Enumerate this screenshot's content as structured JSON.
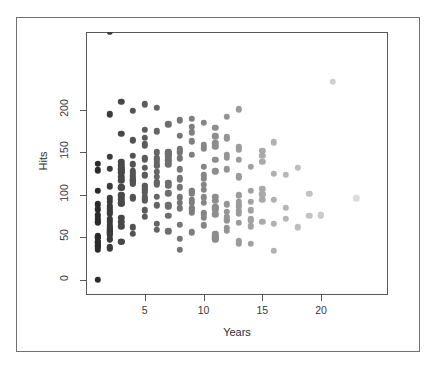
{
  "figure": {
    "clipped_header_text": "·  ·   ·      ·     · ·      ·     ·   · ·",
    "frame_color": "#6f6f73",
    "plot_box_color": "#58585c",
    "background": "#ffffff"
  },
  "chart_data": {
    "type": "scatter",
    "title": "",
    "subtitle": "",
    "xlabel": "Years",
    "ylabel": "Hits",
    "xlim": [
      0,
      25.7
    ],
    "ylim": [
      -18,
      292
    ],
    "grid": false,
    "legend": null,
    "xticks": [
      5,
      10,
      15,
      20
    ],
    "yticks": [
      0,
      50,
      100,
      150,
      200
    ],
    "point_shape": "filled-circle",
    "point_radius_px": 3.2,
    "color_scheme": "grayscale: darker points at low Years, lighter points at high Years",
    "color_dark": "#2b2b2b",
    "color_light": "#dcdcdc",
    "n_points": 263,
    "x": [
      13,
      3,
      11,
      2,
      11,
      2,
      3,
      2,
      13,
      10,
      9,
      4,
      6,
      13,
      3,
      15,
      5,
      8,
      1,
      14,
      2,
      9,
      3,
      5,
      2,
      8,
      13,
      3,
      20,
      8,
      5,
      3,
      1,
      17,
      2,
      14,
      2,
      11,
      2,
      4,
      10,
      8,
      5,
      6,
      4,
      12,
      6,
      11,
      1,
      16,
      3,
      13,
      7,
      2,
      4,
      9,
      5,
      18,
      2,
      6,
      5,
      12,
      4,
      7,
      1,
      15,
      3,
      10,
      2,
      8,
      6,
      13,
      4,
      11,
      2,
      19,
      5,
      9,
      3,
      7,
      1,
      14,
      6,
      12,
      2,
      10,
      4,
      16,
      3,
      8,
      5,
      11,
      1,
      13,
      7,
      9,
      2,
      15,
      4,
      6,
      3,
      12,
      1,
      10,
      5,
      8,
      2,
      14,
      6,
      11,
      4,
      7,
      3,
      17,
      1,
      9,
      5,
      13,
      2,
      10,
      6,
      12,
      4,
      8,
      3,
      15,
      1,
      11,
      7,
      9,
      2,
      16,
      5,
      10,
      4,
      13,
      3,
      7,
      1,
      12,
      6,
      8,
      2,
      14,
      5,
      9,
      3,
      11,
      4,
      18,
      1,
      10,
      7,
      13,
      2,
      8,
      6,
      12,
      5,
      15,
      3,
      9,
      1,
      11,
      4,
      7,
      2,
      20,
      6,
      10,
      5,
      13,
      3,
      8,
      1,
      14,
      4,
      9,
      7,
      11,
      2,
      12,
      5,
      16,
      3,
      10,
      6,
      8,
      1,
      13,
      4,
      15,
      2,
      9,
      7,
      11,
      5,
      12,
      3,
      17,
      1,
      10,
      6,
      14,
      4,
      8,
      2,
      13,
      5,
      9,
      3,
      11,
      7,
      19,
      1,
      12,
      6,
      10,
      4,
      15,
      2,
      8,
      5,
      13,
      3,
      9,
      1,
      16,
      7,
      11,
      4,
      12,
      6,
      10,
      2,
      14,
      5,
      8,
      3,
      13,
      1,
      9,
      7,
      11,
      21,
      6,
      4,
      12,
      2,
      10,
      5,
      1,
      3,
      8,
      15,
      13,
      9,
      7,
      11,
      23,
      6,
      12,
      2
    ],
    "y": [
      81,
      130,
      141,
      87,
      169,
      37,
      73,
      81,
      92,
      159,
      163,
      54,
      141,
      88,
      121,
      146,
      95,
      97,
      76,
      71,
      84,
      102,
      126,
      144,
      56,
      130,
      99,
      90,
      76,
      143,
      177,
      100,
      83,
      124,
      72,
      105,
      60,
      157,
      48,
      136,
      119,
      152,
      132,
      112,
      118,
      89,
      150,
      77,
      50,
      94,
      108,
      67,
      141,
      92,
      165,
      85,
      123,
      62,
      57,
      138,
      110,
      74,
      96,
      149,
      44,
      101,
      131,
      79,
      69,
      154,
      127,
      86,
      113,
      98,
      64,
      75,
      160,
      91,
      117,
      145,
      52,
      82,
      134,
      70,
      47,
      106,
      122,
      66,
      139,
      109,
      158,
      93,
      41,
      78,
      148,
      104,
      59,
      68,
      128,
      115,
      135,
      80,
      39,
      97,
      167,
      120,
      55,
      63,
      143,
      85,
      125,
      151,
      90,
      72,
      36,
      174,
      111,
      100,
      61,
      133,
      87,
      147,
      116,
      65,
      95,
      107,
      129,
      49,
      140,
      83,
      53,
      162,
      103,
      73,
      119,
      156,
      45,
      88,
      137,
      58,
      114,
      170,
      96,
      42,
      124,
      79,
      108,
      51,
      146,
      132,
      67,
      91,
      102,
      153,
      38,
      84,
      121,
      71,
      142,
      94,
      63,
      180,
      105,
      47,
      113,
      86,
      131,
      76,
      59,
      155,
      98,
      43,
      127,
      118,
      69,
      92,
      164,
      81,
      136,
      54,
      110,
      144,
      74,
      34,
      99,
      123,
      66,
      150,
      89,
      46,
      116,
      139,
      78,
      104,
      57,
      128,
      93,
      61,
      172,
      85,
      40,
      112,
      134,
      70,
      97,
      48,
      145,
      120,
      82,
      56,
      109,
      161,
      75,
      101,
      44,
      130,
      88,
      64,
      117,
      152,
      79,
      35,
      106,
      141,
      68,
      94,
      50,
      125,
      114,
      83,
      62,
      166,
      98,
      77,
      53,
      133,
      107,
      91,
      45,
      122,
      72,
      147,
      111,
      86,
      233,
      203,
      199,
      192,
      195,
      185,
      207,
      0,
      210,
      188,
      100,
      201,
      190,
      183,
      179,
      96,
      175,
      168
    ]
  },
  "axis": {
    "y_ticks": [
      {
        "value": 200,
        "label": "200"
      },
      {
        "value": 150,
        "label": "150"
      },
      {
        "value": 100,
        "label": "100"
      },
      {
        "value": 50,
        "label": "50"
      },
      {
        "value": 0,
        "label": "0"
      }
    ],
    "x_ticks": [
      {
        "value": 5,
        "label": "5"
      },
      {
        "value": 10,
        "label": "10"
      },
      {
        "value": 15,
        "label": "15"
      },
      {
        "value": 20,
        "label": "20"
      }
    ],
    "y_title": "Hits",
    "x_title": "Years"
  }
}
